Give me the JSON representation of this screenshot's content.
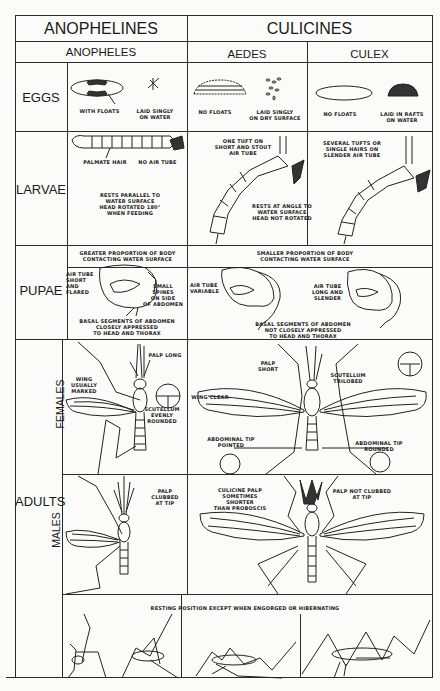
{
  "header": {
    "group_anophelines": "ANOPHELINES",
    "group_culicines": "CULICINES",
    "genus_anopheles": "ANOPHELES",
    "genus_aedes": "AEDES",
    "genus_culex": "CULEX"
  },
  "rows": {
    "eggs": "EGGS",
    "larvae": "LARVAE",
    "pupae": "PUPAE",
    "adults": "ADULTS",
    "females": "FEMALES",
    "males": "MALES"
  },
  "eggs": {
    "anopheles_a": "WITH FLOATS",
    "anopheles_b": "LAID SINGLY\nON WATER",
    "aedes_a": "NO FLOATS",
    "aedes_b": "LAID SINGLY\nON DRY SURFACE",
    "culex_a": "NO FLOATS",
    "culex_b": "LAID IN RAFTS\nON WATER"
  },
  "larvae": {
    "anopheles_palmate": "PALMATE HAIR",
    "anopheles_no_tube": "NO AIR TUBE",
    "anopheles_rest": "RESTS PARALLEL TO\nWATER SURFACE\nHEAD ROTATED 180°\nWHEN FEEDING",
    "aedes_tuft": "ONE TUFT ON\nSHORT AND STOUT\nAIR TUBE",
    "culex_tufts": "SEVERAL TUFTS OR\nSINGLE HAIRS ON\nSLENDER AIR TUBE",
    "culicine_rest": "RESTS AT ANGLE TO\nWATER SURFACE\nHEAD NOT ROTATED"
  },
  "pupae": {
    "anopheles_top": "GREATER PROPORTION OF BODY\nCONTACTING WATER SURFACE",
    "anopheles_tube": "AIR TUBE\nSHORT AND\nFLARED",
    "anopheles_spines": "SMALL SPINES\nON SIDE\nOF ABDOMEN",
    "anopheles_bottom": "BASAL SEGMENTS OF ABDOMEN\nCLOSELY APPRESSED\nTO HEAD AND THORAX",
    "culicine_top": "SMALLER PROPORTION OF BODY\nCONTACTING WATER SURFACE",
    "aedes_tube": "AIR TUBE\nVARIABLE",
    "culex_tube": "AIR TUBE\nLONG AND SLENDER",
    "culicine_bottom": "BASAL SEGMENTS OF ABDOMEN\nNOT CLOSELY APPRESSED\nTO HEAD AND THORAX"
  },
  "adults_female": {
    "anopheles_palp": "PALP LONG",
    "anopheles_wing": "WING\nUSUALLY\nMARKED",
    "anopheles_scutellum": "SCUTELLUM\nEVENLY\nROUNDED",
    "culicine_palp": "PALP SHORT",
    "culicine_scutellum": "SCUTELLUM\nTRILOBED",
    "culicine_wing": "WING CLEAR",
    "aedes_tip": "ABDOMINAL TIP\nPOINTED",
    "culex_tip": "ABDOMINAL TIP\nROUNDED"
  },
  "adults_male": {
    "anopheles_palp": "PALP CLUBBED\nAT TIP",
    "culicine_palp_a": "CULICINE PALP\nSOMETIMES SHORTER\nTHAN PROBOSCIS",
    "culicine_palp_b": "PALP NOT CLUBBED\nAT TIP"
  },
  "resting": {
    "caption": "RESTING POSITION EXCEPT WHEN ENGORGED OR HIBERNATING"
  }
}
